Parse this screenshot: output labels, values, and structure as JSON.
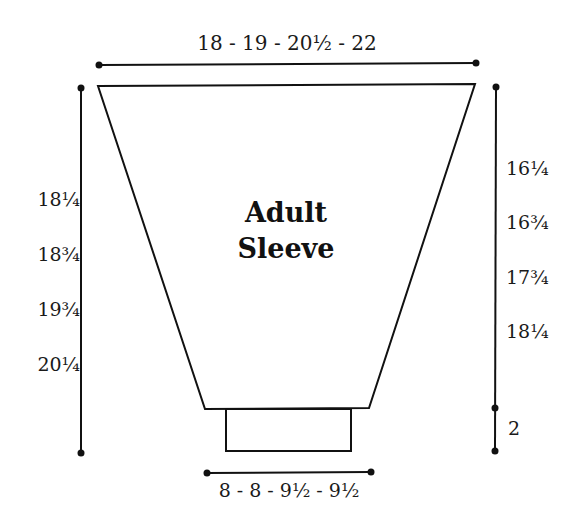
{
  "diagram": {
    "title_line1": "Adult",
    "title_line2": "Sleeve",
    "top_width": "18 - 19 - 20½ - 22",
    "bottom_width": "8 - 8 - 9½ - 9½",
    "left_lengths": [
      "18¼",
      "18¾",
      "19¾",
      "20¼"
    ],
    "right_lengths": [
      "16¼",
      "16¾",
      "17¾",
      "18¼"
    ],
    "cuff_length": "2",
    "colors": {
      "line": "#111111",
      "background": "#ffffff"
    }
  }
}
